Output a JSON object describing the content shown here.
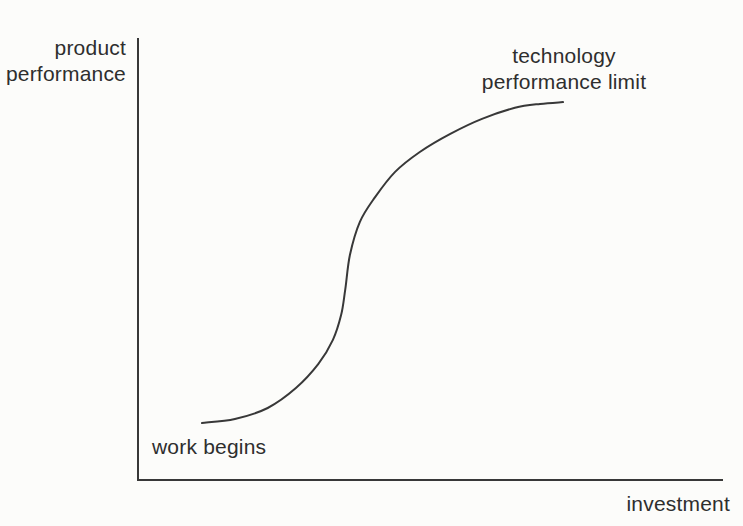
{
  "figure": {
    "background": "#fcfcfa",
    "text_color": "#2e2e2e",
    "line_color": "#383838"
  },
  "labels": {
    "y_axis": [
      "product",
      "performance"
    ],
    "x_axis": "investment",
    "limit_annotation": [
      "technology",
      "performance limit"
    ],
    "start_annotation": "work begins"
  },
  "chart_data": {
    "type": "line",
    "title": "",
    "xlabel": "investment",
    "ylabel": "product performance",
    "xlim": [
      0,
      100
    ],
    "ylim": [
      0,
      100
    ],
    "grid": false,
    "axes_style": "bare L-shaped axes, no ticks or numeric scale (conceptual diagram)",
    "annotations": [
      {
        "text": "work begins",
        "anchor": "start of curve, below lower flat segment"
      },
      {
        "text": "technology performance limit",
        "anchor": "above upper flat end of curve"
      }
    ],
    "series": [
      {
        "name": "technology S-curve",
        "units": "relative (no numeric scale shown)",
        "points": [
          [
            10.9,
            12.9
          ],
          [
            16.5,
            13.8
          ],
          [
            22.1,
            16.3
          ],
          [
            26.9,
            20.8
          ],
          [
            30.7,
            26.2
          ],
          [
            33.2,
            31.7
          ],
          [
            34.6,
            37.3
          ],
          [
            35.3,
            43.0
          ],
          [
            36.1,
            50.9
          ],
          [
            37.8,
            58.4
          ],
          [
            40.4,
            64.0
          ],
          [
            43.8,
            69.7
          ],
          [
            48.0,
            74.2
          ],
          [
            53.2,
            78.3
          ],
          [
            58.6,
            81.7
          ],
          [
            64.2,
            84.2
          ],
          [
            68.5,
            85.1
          ],
          [
            72.4,
            85.5
          ]
        ]
      }
    ]
  }
}
